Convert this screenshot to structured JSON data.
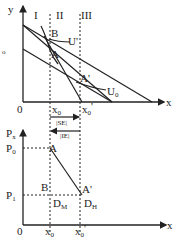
{
  "top_graph": {
    "y_axis_label": "y",
    "x_axis_label": "x",
    "origin_label": "0",
    "region_labels": [
      "I",
      "II",
      "III"
    ],
    "points": {
      "A": "A",
      "B": "B",
      "A_prime": "A'"
    },
    "curves": {
      "U_prime": "U'",
      "U0": "U",
      "U0_sub": "0"
    },
    "x_ticks": {
      "x0": "x",
      "x0_sub": "0",
      "x0_prime": "x",
      "x0_prime_sub": "0",
      "x0_prime_mark": "'"
    },
    "stray_mark": "o"
  },
  "effects": {
    "substitution": "|SE|",
    "income": "|IE|"
  },
  "bottom_graph": {
    "y_axis_label": "P",
    "y_axis_sub": "x",
    "x_axis_label": "x",
    "origin_label": "0",
    "prices": {
      "P0": "P",
      "P0_sub": "0",
      "P1": "P",
      "P1_sub": "1"
    },
    "points": {
      "A": "A",
      "B": "B",
      "A_prime": "A'",
      "DM": "D",
      "DM_sub": "M",
      "DH": "D",
      "DH_sub": "H"
    },
    "x_ticks": {
      "x0": "x",
      "x0_sub": "0",
      "x0_prime": "x",
      "x0_prime_sub": "0",
      "x0_prime_mark": "'"
    }
  }
}
